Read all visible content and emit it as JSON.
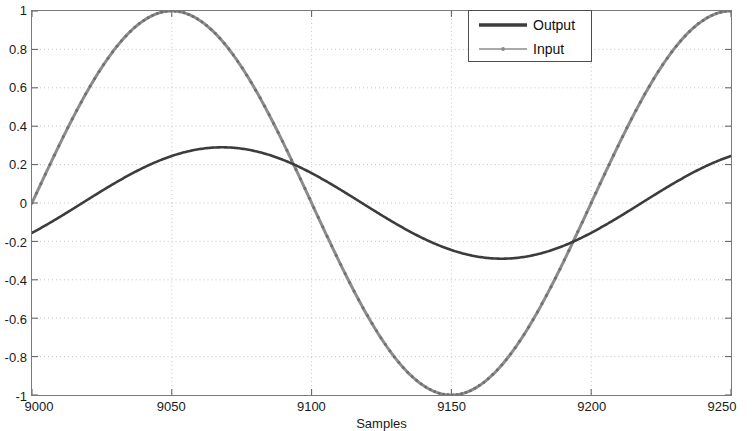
{
  "chart_data": {
    "type": "line",
    "title": "",
    "xlabel": "Samples",
    "ylabel": "",
    "xlim": [
      9000,
      9250
    ],
    "ylim": [
      -1,
      1
    ],
    "grid": true,
    "grid_style": "dotted",
    "legend_position": "top-right",
    "xticks": [
      9000,
      9050,
      9100,
      9150,
      9200,
      9250
    ],
    "xtick_labels": [
      "9000",
      "9050",
      "9100",
      "9150",
      "9200",
      "9250"
    ],
    "yticks": [
      -1,
      -0.8,
      -0.6,
      -0.4,
      -0.2,
      0,
      0.2,
      0.4,
      0.6,
      0.8,
      1
    ],
    "ytick_labels": [
      "-1",
      "-0.8",
      "-0.6",
      "-0.4",
      "-0.2",
      "0",
      "0.2",
      "0.4",
      "0.6",
      "0.8",
      "1"
    ],
    "series": [
      {
        "name": "Output",
        "color": "#3c3c3c",
        "line_width": 2.6,
        "marker": "none",
        "amplitude": 0.29,
        "period": 200,
        "peak_x": 9068,
        "trough_x": 9168,
        "x": [
          9000,
          9010,
          9020,
          9030,
          9040,
          9050,
          9060,
          9070,
          9080,
          9090,
          9100,
          9110,
          9120,
          9130,
          9140,
          9150,
          9160,
          9170,
          9180,
          9190,
          9200,
          9210,
          9220,
          9230,
          9240,
          9250
        ],
        "y": [
          -0.15,
          -0.09,
          -0.02,
          0.05,
          0.12,
          0.19,
          0.25,
          0.29,
          0.29,
          0.27,
          0.22,
          0.15,
          0.08,
          0.0,
          -0.08,
          -0.16,
          -0.23,
          -0.28,
          -0.29,
          -0.28,
          -0.24,
          -0.18,
          -0.1,
          -0.02,
          0.11,
          0.24
        ]
      },
      {
        "name": "Input",
        "color": "#8c8c8c",
        "line_width": 3.0,
        "marker": "dot",
        "amplitude": 1.0,
        "period": 200,
        "peak_x": 9050,
        "trough_x": 9150,
        "x": [
          9000,
          9010,
          9020,
          9030,
          9040,
          9050,
          9060,
          9070,
          9080,
          9090,
          9100,
          9110,
          9120,
          9130,
          9140,
          9150,
          9160,
          9170,
          9180,
          9190,
          9200,
          9210,
          9220,
          9230,
          9240,
          9250
        ],
        "y": [
          -0.07,
          0.24,
          0.53,
          0.76,
          0.93,
          1.0,
          0.97,
          0.85,
          0.64,
          0.38,
          0.09,
          -0.22,
          -0.5,
          -0.74,
          -0.92,
          -1.0,
          -0.98,
          -0.86,
          -0.66,
          -0.4,
          -0.11,
          0.2,
          0.48,
          0.73,
          0.91,
          1.0
        ]
      }
    ]
  },
  "legend": {
    "entries": [
      {
        "label": "Output"
      },
      {
        "label": "Input"
      }
    ]
  },
  "axis": {
    "xlabel": "Samples"
  }
}
